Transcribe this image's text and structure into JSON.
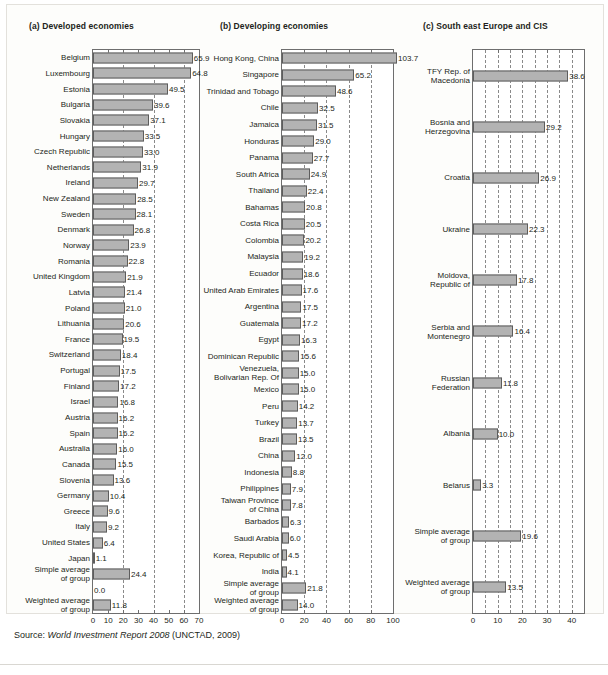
{
  "figure": {
    "source_prefix": "Source: ",
    "source_italic": "World Investment Report 2008",
    "source_suffix": " (UNCTAD, 2009)"
  },
  "chart_data": [
    {
      "type": "bar",
      "orientation": "horizontal",
      "panel_id": "a",
      "title": "(a) Developed economies",
      "xlabel": "",
      "ylabel": "",
      "xlim": [
        0,
        70
      ],
      "xticks": [
        0,
        10,
        20,
        30,
        40,
        50,
        60,
        70
      ],
      "gridlines": [
        20,
        40,
        60
      ],
      "grid": true,
      "legend": "none",
      "categories": [
        "Belgium",
        "Luxembourg",
        "Estonia",
        "Bulgaria",
        "Slovakia",
        "Hungary",
        "Czech Republic",
        "Netherlands",
        "Ireland",
        "New Zealand",
        "Sweden",
        "Denmark",
        "Norway",
        "Romania",
        "United Kingdom",
        "Latvia",
        "Poland",
        "Lithuania",
        "France",
        "Switzerland",
        "Portugal",
        "Finland",
        "Israel",
        "Austria",
        "Spain",
        "Australia",
        "Canada",
        "Slovenia",
        "Germany",
        "Greece",
        "Italy",
        "United States",
        "Japan",
        "Simple average of group",
        "",
        "Weighted average of group"
      ],
      "values": [
        65.9,
        64.8,
        49.5,
        39.6,
        37.1,
        33.5,
        33.0,
        31.9,
        29.7,
        28.5,
        28.1,
        26.8,
        23.9,
        22.8,
        21.9,
        21.4,
        21.0,
        20.6,
        19.5,
        18.4,
        17.5,
        17.2,
        16.8,
        16.2,
        16.2,
        16.0,
        15.5,
        13.6,
        10.4,
        9.6,
        9.2,
        6.4,
        1.1,
        24.4,
        0.0,
        11.8
      ],
      "value_labels": [
        "65.9",
        "64.8",
        "49.5",
        "39.6",
        "37.1",
        "33.5",
        "33.0",
        "31.9",
        "29.7",
        "28.5",
        "28.1",
        "26.8",
        "23.9",
        "22.8",
        "21.9",
        "21.4",
        "21.0",
        "20.6",
        "19.5",
        "18.4",
        "17.5",
        "17.2",
        "16.8",
        "16.2",
        "16.2",
        "16.0",
        "15.5",
        "13.6",
        "10.4",
        "9.6",
        "9.2",
        "6.4",
        "1.1",
        "24.4",
        "0.0",
        "11.8"
      ]
    },
    {
      "type": "bar",
      "orientation": "horizontal",
      "panel_id": "b",
      "title": "(b) Developing economies",
      "xlabel": "",
      "ylabel": "",
      "xlim": [
        0,
        100
      ],
      "xticks": [
        0,
        20,
        40,
        60,
        80,
        100
      ],
      "gridlines": [
        20,
        40,
        60,
        80
      ],
      "grid": true,
      "legend": "none",
      "categories": [
        "Hong Kong, China",
        "Singapore",
        "Trinidad and Tobago",
        "Chile",
        "Jamaica",
        "Honduras",
        "Panama",
        "South Africa",
        "Thailand",
        "Bahamas",
        "Costa Rica",
        "Colombia",
        "Malaysia",
        "Ecuador",
        "United Arab Emirates",
        "Argentina",
        "Guatemala",
        "Egypt",
        "Dominican Republic",
        "Venezuela, Bolivarian Rep. Of",
        "Mexico",
        "Peru",
        "Turkey",
        "Brazil",
        "China",
        "Indonesia",
        "Philippines",
        "Taiwan Province of China",
        "Barbados",
        "Saudi Arabia",
        "Korea, Republic of",
        "India",
        "Simple average of group",
        "Weighted average of group"
      ],
      "values": [
        103.7,
        65.2,
        48.6,
        32.5,
        31.5,
        29.0,
        27.7,
        24.9,
        22.4,
        20.8,
        20.5,
        20.2,
        19.2,
        18.6,
        17.6,
        17.5,
        17.2,
        16.3,
        15.6,
        15.0,
        15.0,
        14.2,
        13.7,
        13.5,
        12.0,
        8.8,
        7.9,
        7.8,
        6.3,
        6.0,
        4.5,
        4.1,
        21.8,
        14.0
      ],
      "value_labels": [
        "103.7",
        "65.2",
        "48.6",
        "32.5",
        "31.5",
        "29.0",
        "27.7",
        "24.9",
        "22.4",
        "20.8",
        "20.5",
        "20.2",
        "19.2",
        "18.6",
        "17.6",
        "17.5",
        "17.2",
        "16.3",
        "15.6",
        "15.0",
        "15.0",
        "14.2",
        "13.7",
        "13.5",
        "12.0",
        "8.8",
        "7.9",
        "7.8",
        "6.3",
        "6.0",
        "4.5",
        "4.1",
        "21.8",
        "14.0"
      ]
    },
    {
      "type": "bar",
      "orientation": "horizontal",
      "panel_id": "c",
      "title": "(c) South east Europe and CIS",
      "xlabel": "",
      "ylabel": "",
      "xlim": [
        0,
        45
      ],
      "xticks": [
        0,
        10,
        20,
        30,
        40
      ],
      "gridlines": [
        5,
        10,
        15,
        20,
        25,
        30,
        35,
        40
      ],
      "grid": true,
      "legend": "none",
      "categories": [
        "TFY Rep. of Macedonia",
        "Bosnia and Herzegovina",
        "Croatia",
        "Ukraine",
        "Moldova, Republic of",
        "Serbia and Montenegro",
        "Russian Federation",
        "Albania",
        "Belarus",
        "Simple average of group",
        "Weighted average of group"
      ],
      "values": [
        38.6,
        29.2,
        26.9,
        22.3,
        17.8,
        16.4,
        11.8,
        10.0,
        3.3,
        19.6,
        13.5
      ],
      "value_labels": [
        "38.6",
        "29.2",
        "26.9",
        "22.3",
        "17.8",
        "16.4",
        "11.8",
        "10.0",
        "3.3",
        "19.6",
        "13.5"
      ]
    }
  ],
  "style": {
    "bar_fill": "#b3b3b3",
    "bar_edge": "#5d5d5d",
    "frame": "#6e6e6e",
    "grid": "#8a8a8a",
    "text": "#231f20",
    "page_bg": "#ffffff",
    "card_bg": "#fdfdfb"
  }
}
